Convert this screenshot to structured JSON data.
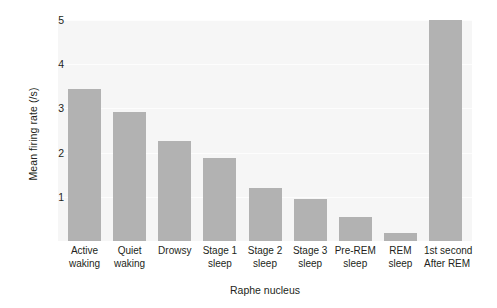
{
  "chart_data": {
    "type": "bar",
    "title": "",
    "xlabel": "Raphe nucleus",
    "ylabel": "Mean firing rate (/s)",
    "categories": [
      "Active waking",
      "Quiet waking",
      "Drowsy",
      "Stage 1 sleep",
      "Stage 2 sleep",
      "Stage 3 sleep",
      "Pre-REM sleep",
      "REM sleep",
      "1st second After REM"
    ],
    "category_lines": [
      [
        "Active",
        "waking"
      ],
      [
        "Quiet",
        "waking"
      ],
      [
        "Drowsy"
      ],
      [
        "Stage 1",
        "sleep"
      ],
      [
        "Stage 2",
        "sleep"
      ],
      [
        "Stage 3",
        "sleep"
      ],
      [
        "Pre-REM",
        "sleep"
      ],
      [
        "REM",
        "sleep"
      ],
      [
        "1st second",
        "After REM"
      ]
    ],
    "values": [
      3.45,
      2.92,
      2.27,
      1.88,
      1.21,
      0.94,
      0.55,
      0.18,
      5.0
    ],
    "ylim": [
      0,
      5
    ],
    "yticks": [
      1,
      2,
      3,
      4,
      5
    ],
    "ytick_labels": [
      "1",
      "2",
      "3",
      "4",
      "5"
    ],
    "grid": true,
    "legend": "none",
    "bar_color": "#b2b2b2",
    "plot_background": "#f6f6f6"
  }
}
